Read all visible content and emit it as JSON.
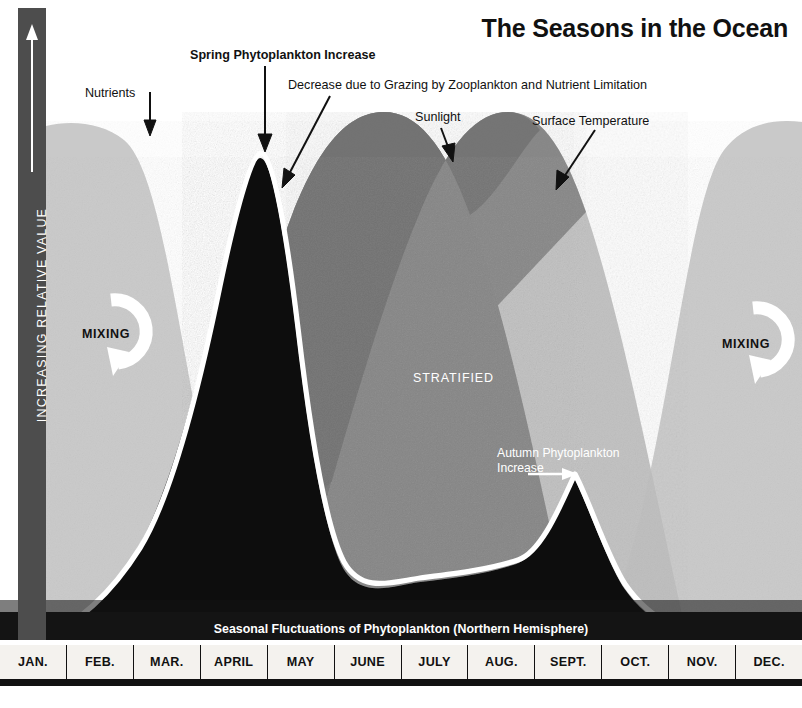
{
  "title": "The Seasons in the Ocean",
  "subtitle": "Seasonal Fluctuations of Phytoplankton (Northern Hemisphere)",
  "yaxis": {
    "label": "INCREASING RELATIVE VALUE",
    "arrow_icon": "up-arrow-icon"
  },
  "annotations": {
    "nutrients": "Nutrients",
    "spring_increase": "Spring Phytoplankton Increase",
    "decrease": "Decrease due to Grazing by Zooplankton and Nutrient Limitation",
    "sunlight": "Sunlight",
    "surface_temperature": "Surface Temperature",
    "mixing_left": "MIXING",
    "mixing_right": "MIXING",
    "stratified": "STRATIFIED",
    "autumn_increase": "Autumn Phytoplankton Increase"
  },
  "colors": {
    "nutrients": "#c9c9c9",
    "sunlight": "#8e8e8e",
    "surface_temperature": "#bdbdbd",
    "stratified_overlap": "#6f6f6f",
    "phytoplankton_fill": "#111111",
    "phytoplankton_line": "#ffffff",
    "axis_bar": "#4d4d4d",
    "month_strip": "#f4f2ee",
    "background": "#ffffff"
  },
  "months": [
    "JAN.",
    "FEB.",
    "MAR.",
    "APRIL",
    "MAY",
    "JUNE",
    "JULY",
    "AUG.",
    "SEPT.",
    "OCT.",
    "NOV.",
    "DEC."
  ],
  "chart_data": {
    "type": "area",
    "title": "The Seasons in the Ocean",
    "subtitle": "Seasonal Fluctuations of Phytoplankton (Northern Hemisphere)",
    "xlabel": "",
    "ylabel": "INCREASING RELATIVE VALUE",
    "categories": [
      "JAN.",
      "FEB.",
      "MAR.",
      "APRIL",
      "MAY",
      "JUNE",
      "JULY",
      "AUG.",
      "SEPT.",
      "OCT.",
      "NOV.",
      "DEC."
    ],
    "x": [
      0,
      1,
      2,
      3,
      4,
      5,
      6,
      7,
      8,
      9,
      10,
      11
    ],
    "ylim": [
      0,
      100
    ],
    "grid": false,
    "legend": "inline-annotations",
    "series": [
      {
        "name": "Nutrients",
        "color": "#c9c9c9",
        "values": [
          96,
          95,
          72,
          30,
          16,
          12,
          11,
          13,
          22,
          48,
          84,
          95
        ],
        "note": "High in winter, depleted through spring bloom, replenished by autumn mixing"
      },
      {
        "name": "Sunlight",
        "color": "#8e8e8e",
        "values": [
          8,
          20,
          45,
          72,
          90,
          97,
          92,
          74,
          48,
          25,
          11,
          6
        ],
        "note": "Peaks near the summer solstice (June)"
      },
      {
        "name": "Surface Temperature",
        "color": "#bdbdbd",
        "values": [
          10,
          8,
          13,
          30,
          55,
          78,
          93,
          96,
          80,
          52,
          26,
          13
        ],
        "note": "Lags sunlight by roughly one to two months, peaking in August"
      },
      {
        "name": "Phytoplankton",
        "color": "#111111",
        "line_color": "#ffffff",
        "values": [
          4,
          9,
          38,
          93,
          35,
          13,
          11,
          13,
          18,
          46,
          20,
          7
        ],
        "note": "Large spring bloom in April, smaller autumn bloom in September"
      }
    ],
    "annotations": [
      {
        "text": "Nutrients",
        "target_series": "Nutrients",
        "x": 1.1,
        "y": 86
      },
      {
        "text": "Spring Phytoplankton Increase",
        "target_series": "Phytoplankton",
        "x": 3.0,
        "y": 93
      },
      {
        "text": "Decrease due to Grazing by Zooplankton and Nutrient Limitation",
        "target_series": "Phytoplankton",
        "x": 3.5,
        "y": 70
      },
      {
        "text": "Sunlight",
        "target_series": "Sunlight",
        "x": 5.6,
        "y": 88
      },
      {
        "text": "Surface Temperature",
        "target_series": "Surface Temperature",
        "x": 7.3,
        "y": 86
      },
      {
        "text": "Autumn Phytoplankton Increase",
        "target_series": "Phytoplankton",
        "x": 8.6,
        "y": 46
      },
      {
        "text": "MIXING",
        "x": 1.0,
        "y": 45
      },
      {
        "text": "MIXING",
        "x": 10.7,
        "y": 44
      },
      {
        "text": "STRATIFIED",
        "x": 5.9,
        "y": 38
      }
    ]
  }
}
